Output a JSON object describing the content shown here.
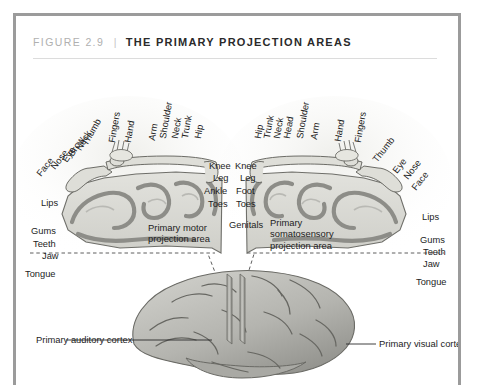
{
  "figure": {
    "number": "FIGURE 2.9",
    "separator": "|",
    "title": "THE PRIMARY PROJECTION AREAS"
  },
  "colors": {
    "frame": "#9b9b9b",
    "rule": "#dcdcdc",
    "figure_number": "#b0b0b0",
    "title": "#2a2a2a",
    "cortex_fill": "#d7d7d2",
    "cortex_band": "#8d8d88",
    "brain_fill": "#b9b9b4",
    "label": "#1d1d1d"
  },
  "callouts": {
    "motor": "Primary motor\nprojection area",
    "motor_line1": "Primary motor",
    "motor_line2": "projection area",
    "somatosensory_line1": "Primary",
    "somatosensory_line2": "somatosensory",
    "somatosensory_line3": "projection area",
    "auditory": "Primary auditory cortex",
    "visual": "Primary visual cortex"
  },
  "left_hemisphere": {
    "name": "primary motor projection area",
    "rotated_labels": [
      {
        "text": "Face",
        "x": 27,
        "y": 106,
        "angle": -52
      },
      {
        "text": "Nose",
        "x": 40,
        "y": 100,
        "angle": -52
      },
      {
        "text": "Eye",
        "x": 52,
        "y": 93,
        "angle": -58
      },
      {
        "text": "Brow",
        "x": 58,
        "y": 88,
        "angle": -58
      },
      {
        "text": "Neck",
        "x": 66,
        "y": 82,
        "angle": -62
      },
      {
        "text": "Thumb",
        "x": 72,
        "y": 78,
        "angle": -62
      },
      {
        "text": "Fingers",
        "x": 101,
        "y": 70,
        "angle": -80
      },
      {
        "text": "Hand",
        "x": 117,
        "y": 70,
        "angle": -80
      },
      {
        "text": "Arm",
        "x": 140,
        "y": 68,
        "angle": -80
      },
      {
        "text": "Shoulder",
        "x": 152,
        "y": 66,
        "angle": -80
      },
      {
        "text": "Neck",
        "x": 164,
        "y": 66,
        "angle": -80
      },
      {
        "text": "Trunk",
        "x": 174,
        "y": 66,
        "angle": -80
      },
      {
        "text": "Hip",
        "x": 186,
        "y": 66,
        "angle": -80
      }
    ],
    "upright_labels": [
      {
        "text": "Knee",
        "x": 193,
        "y": 104
      },
      {
        "text": "Leg",
        "x": 197,
        "y": 116
      },
      {
        "text": "Ankle",
        "x": 192,
        "y": 129
      },
      {
        "text": "Toes",
        "x": 196,
        "y": 142
      },
      {
        "text": "Lips",
        "x": 25,
        "y": 141
      },
      {
        "text": "Gums",
        "x": 18,
        "y": 169
      },
      {
        "text": "Teeth",
        "x": 19,
        "y": 182
      },
      {
        "text": "Jaw",
        "x": 29,
        "y": 194
      },
      {
        "text": "Tongue",
        "x": 12,
        "y": 213
      }
    ]
  },
  "right_hemisphere": {
    "name": "primary somatosensory projection area",
    "rotated_labels": [
      {
        "text": "Hip",
        "x": 247,
        "y": 100,
        "angle": -80
      },
      {
        "text": "Trunk",
        "x": 257,
        "y": 100,
        "angle": -80
      },
      {
        "text": "Neck",
        "x": 267,
        "y": 100,
        "angle": -80
      },
      {
        "text": "Head",
        "x": 277,
        "y": 100,
        "angle": -80
      },
      {
        "text": "Shoulder",
        "x": 289,
        "y": 100,
        "angle": -80
      },
      {
        "text": "Arm",
        "x": 302,
        "y": 100,
        "angle": -80
      },
      {
        "text": "Hand",
        "x": 327,
        "y": 100,
        "angle": -80
      },
      {
        "text": "Fingers",
        "x": 347,
        "y": 100,
        "angle": -80
      },
      {
        "text": "Thumb",
        "x": 369,
        "y": 115,
        "angle": -52
      },
      {
        "text": "Eye",
        "x": 386,
        "y": 124,
        "angle": -52
      },
      {
        "text": "Nose",
        "x": 398,
        "y": 124,
        "angle": -52
      },
      {
        "text": "Face",
        "x": 407,
        "y": 131,
        "angle": -52
      }
    ],
    "upright_labels": [
      {
        "text": "Knee",
        "x": 218,
        "y": 104
      },
      {
        "text": "Leg",
        "x": 222,
        "y": 116
      },
      {
        "text": "Foot",
        "x": 220,
        "y": 129
      },
      {
        "text": "Toes",
        "x": 220,
        "y": 142
      },
      {
        "text": "Genitals",
        "x": 213,
        "y": 163
      },
      {
        "text": "Lips",
        "x": 409,
        "y": 155
      },
      {
        "text": "Gums",
        "x": 409,
        "y": 178
      },
      {
        "text": "Teeth",
        "x": 412,
        "y": 190
      },
      {
        "text": "Jaw",
        "x": 412,
        "y": 202
      },
      {
        "text": "Tongue",
        "x": 406,
        "y": 220
      }
    ]
  }
}
